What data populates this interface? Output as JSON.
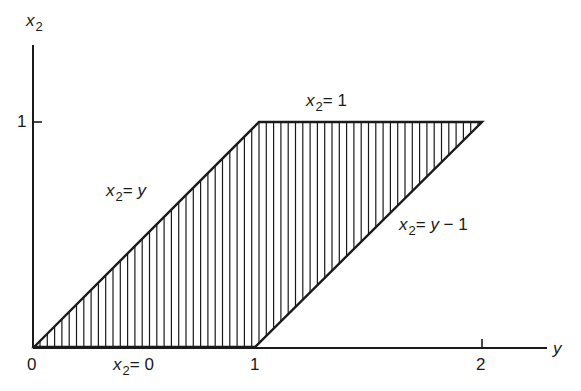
{
  "diagram": {
    "type": "region-plot",
    "axes": {
      "x_label": "y",
      "y_label_var": "x",
      "y_label_sub": "2",
      "x_ticks": [
        "0",
        "1",
        "2"
      ],
      "y_ticks": [
        "1"
      ]
    },
    "lines": {
      "top": {
        "var": "x",
        "sub": "2",
        "rhs": "= 1"
      },
      "bottom": {
        "var": "x",
        "sub": "2",
        "rhs": "= 0"
      },
      "left": {
        "var": "x",
        "sub": "2",
        "rhs_pre": "= ",
        "rhs_var": "y",
        "rhs_post": ""
      },
      "right": {
        "var": "x",
        "sub": "2",
        "rhs_pre": "= ",
        "rhs_var": "y",
        "rhs_post": " − 1"
      }
    },
    "region": {
      "vertices": [
        [
          0,
          0
        ],
        [
          1,
          1
        ],
        [
          2,
          1
        ],
        [
          1,
          0
        ]
      ],
      "fill": "vertical-hatching"
    },
    "colors": {
      "ink": "#1a1a1a",
      "background": "#ffffff"
    }
  },
  "chart_data": {
    "type": "area",
    "title": "",
    "xlabel": "y",
    "ylabel": "x2",
    "xlim": [
      0,
      2
    ],
    "ylim": [
      0,
      1
    ],
    "x_ticks": [
      0,
      1,
      2
    ],
    "y_ticks": [
      1
    ],
    "grid": false,
    "region_vertices": [
      [
        0,
        0
      ],
      [
        1,
        1
      ],
      [
        2,
        1
      ],
      [
        1,
        0
      ]
    ],
    "boundaries": [
      {
        "label": "x2 = y",
        "from": [
          0,
          0
        ],
        "to": [
          1,
          1
        ]
      },
      {
        "label": "x2 = 1",
        "from": [
          1,
          1
        ],
        "to": [
          2,
          1
        ]
      },
      {
        "label": "x2 = y - 1",
        "from": [
          1,
          0
        ],
        "to": [
          2,
          1
        ]
      },
      {
        "label": "x2 = 0",
        "from": [
          0,
          0
        ],
        "to": [
          1,
          0
        ]
      }
    ]
  }
}
